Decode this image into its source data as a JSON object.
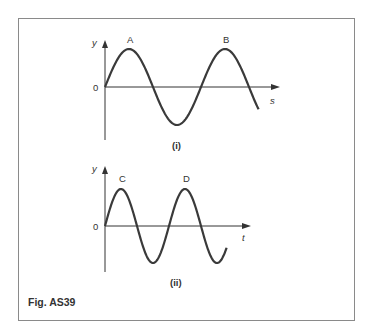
{
  "figure": {
    "caption": "Fig. AS39",
    "frame_color": "#8a8a8a",
    "curve_color": "#3a3a3a",
    "panels": [
      {
        "id": "i",
        "label": "(i)",
        "y_axis_label": "y",
        "x_axis_label": "s",
        "origin_label": "0",
        "peaks": [
          {
            "label": "A"
          },
          {
            "label": "B"
          }
        ]
      },
      {
        "id": "ii",
        "label": "(ii)",
        "y_axis_label": "y",
        "x_axis_label": "t",
        "origin_label": "0",
        "peaks": [
          {
            "label": "C"
          },
          {
            "label": "D"
          }
        ]
      }
    ]
  },
  "chart_data": [
    {
      "type": "line",
      "title": "(i)",
      "xlabel": "s",
      "ylabel": "y",
      "description": "Sine wave starting at origin, about 1.6 cycles shown; peaks labelled A and B",
      "series": [
        {
          "name": "displacement vs distance",
          "function": "sin",
          "cycles_shown": 1.6,
          "peaks": [
            "A",
            "B"
          ],
          "troughs": 1
        }
      ],
      "grid": false
    },
    {
      "type": "line",
      "title": "(ii)",
      "xlabel": "t",
      "ylabel": "y",
      "description": "Sine wave starting at origin, shorter period, about 1.9 cycles shown; peaks labelled C and D",
      "series": [
        {
          "name": "displacement vs time",
          "function": "sin",
          "cycles_shown": 1.9,
          "peaks": [
            "C",
            "D"
          ],
          "troughs": 2
        }
      ],
      "grid": false
    }
  ]
}
